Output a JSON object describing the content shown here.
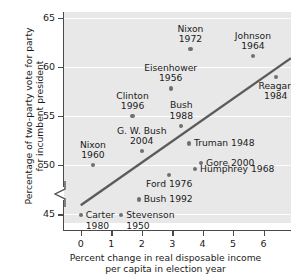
{
  "chart_data": {
    "type": "scatter",
    "title": "",
    "xlabel": "Percent change in real disposable income per capita in election year",
    "xlabel_line1": "Percent change in real disposable income",
    "xlabel_line2": "per capita in election year",
    "ylabel": "Percentage of two-party vote for party for incumbent president",
    "ylabel_line1": "Percentage of two-party vote for party",
    "ylabel_line2": "for incumbent president",
    "xlim": [
      -0.55,
      6.9
    ],
    "ylim": [
      44.1,
      65.6
    ],
    "xticks": [
      0,
      1,
      2,
      3,
      4,
      5,
      6
    ],
    "xtick_labels": [
      "0",
      "1",
      "2",
      "3",
      "4",
      "5",
      "6"
    ],
    "yticks": [
      45,
      50,
      55,
      60,
      65
    ],
    "ytick_labels": [
      "45",
      "50",
      "55",
      "60",
      "65"
    ],
    "grid": true,
    "axis_break": true,
    "legend": "none",
    "point_color": "#707070",
    "trendline_color": "#5b5b5b",
    "panel_color": "#e8e8e8",
    "trendline": {
      "x0": 0.0,
      "y0": 45.9,
      "x1": 6.9,
      "y1": 60.9
    },
    "points": [
      {
        "label_line1": "Nixon",
        "label_line2": "1972",
        "label": "Nixon 1972",
        "x": 3.6,
        "y": 61.8,
        "label_pos": "above-center"
      },
      {
        "label_line1": "Johnson",
        "label_line2": "1964",
        "label": "Johnson 1964",
        "x": 5.65,
        "y": 61.1,
        "label_pos": "above-center"
      },
      {
        "label_line1": "Eisenhower",
        "label_line2": "1956",
        "label": "Eisenhower 1956",
        "x": 2.95,
        "y": 57.8,
        "label_pos": "above-center"
      },
      {
        "label_line1": "Reagan",
        "label_line2": "1984",
        "label": "Reagan 1984",
        "x": 6.4,
        "y": 59.0,
        "label_pos": "below-center"
      },
      {
        "label_line1": "Clinton",
        "label_line2": "1996",
        "label": "Clinton 1996",
        "x": 1.7,
        "y": 55.0,
        "label_pos": "above-center"
      },
      {
        "label_line1": "Bush",
        "label_line2": "1988",
        "label": "Bush 1988",
        "x": 3.3,
        "y": 54.0,
        "label_pos": "above-center"
      },
      {
        "label_line1": "G. W. Bush",
        "label_line2": "2004",
        "label": "G. W. Bush 2004",
        "x": 2.0,
        "y": 51.4,
        "label_pos": "above-center"
      },
      {
        "label_line1": "Truman 1948",
        "label_line2": "",
        "label": "Truman 1948",
        "x": 3.55,
        "y": 52.2,
        "label_pos": "right"
      },
      {
        "label_line1": "Nixon",
        "label_line2": "1960",
        "label": "Nixon 1960",
        "x": 0.4,
        "y": 50.0,
        "label_pos": "above-center"
      },
      {
        "label_line1": "Gore 2000",
        "label_line2": "",
        "label": "Gore 2000",
        "x": 3.95,
        "y": 50.2,
        "label_pos": "right"
      },
      {
        "label_line1": "Humphrey 1968",
        "label_line2": "",
        "label": "Humphrey 1968",
        "x": 3.75,
        "y": 49.6,
        "label_pos": "right"
      },
      {
        "label_line1": "Ford 1976",
        "label_line2": "",
        "label": "Ford 1976",
        "x": 2.9,
        "y": 49.0,
        "label_pos": "below-center"
      },
      {
        "label_line1": "Bush 1992",
        "label_line2": "",
        "label": "Bush 1992",
        "x": 1.9,
        "y": 46.5,
        "label_pos": "right"
      },
      {
        "label_line1": "Carter",
        "label_line2": "1980",
        "label": "Carter 1980",
        "x": 0.0,
        "y": 44.9,
        "label_pos": "right-2line"
      },
      {
        "label_line1": "Stevenson",
        "label_line2": "1950",
        "label": "Stevenson 1950",
        "x": 1.33,
        "y": 44.9,
        "label_pos": "right-2line"
      }
    ]
  }
}
